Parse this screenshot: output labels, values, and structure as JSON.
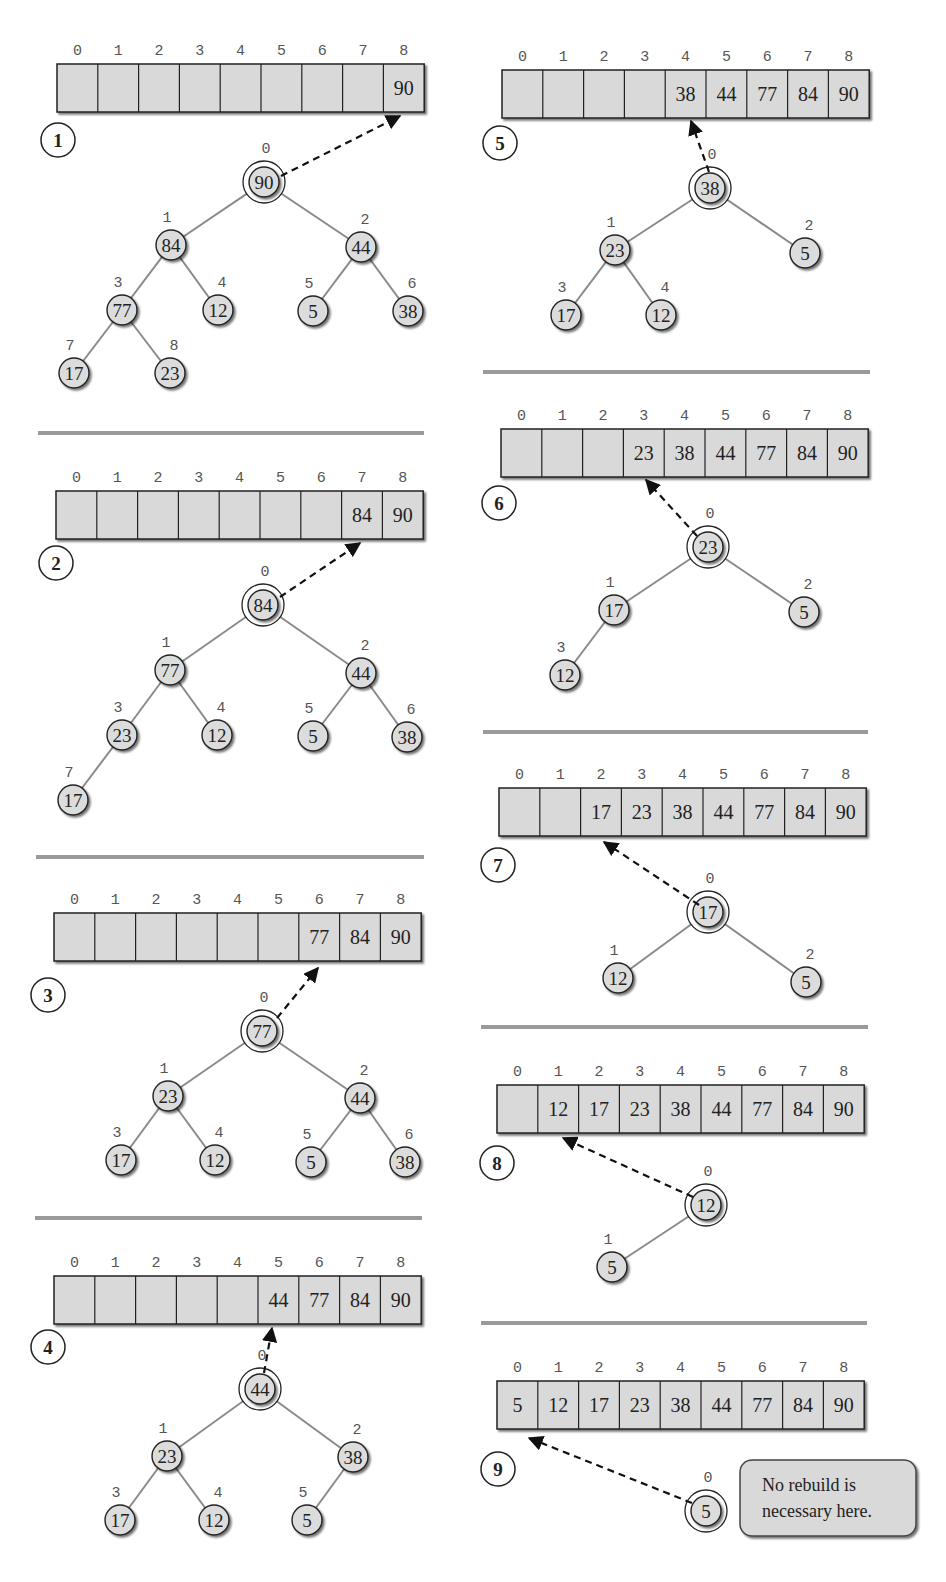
{
  "figure": {
    "colors": {
      "cell_fill": "#d9d9d9",
      "node_fill": "#dcdcdc",
      "edge": "#8a8a8a",
      "separator": "#9a9a9a",
      "text": "#222222",
      "index": "#555555"
    },
    "note": {
      "line1": "No rebuild is",
      "line2": "necessary here."
    },
    "panels": [
      {
        "step": "1",
        "array": [
          "",
          "",
          "",
          "",
          "",
          "",
          "",
          "",
          "90"
        ],
        "array_box": {
          "x": 57,
          "y": 64,
          "cw": 40.8,
          "h": 48
        },
        "circle": {
          "x": 58,
          "y": 140
        },
        "arrow": {
          "x1": 281,
          "y1": 176,
          "x2": 400,
          "y2": 116
        },
        "nodes": [
          {
            "i": 0,
            "v": "90",
            "x": 264,
            "y": 182
          },
          {
            "i": 1,
            "v": "84",
            "x": 171,
            "y": 245
          },
          {
            "i": 2,
            "v": "44",
            "x": 361,
            "y": 247
          },
          {
            "i": 3,
            "v": "77",
            "x": 122,
            "y": 310
          },
          {
            "i": 4,
            "v": "12",
            "x": 218,
            "y": 310
          },
          {
            "i": 5,
            "v": "5",
            "x": 313,
            "y": 311
          },
          {
            "i": 6,
            "v": "38",
            "x": 408,
            "y": 311
          },
          {
            "i": 7,
            "v": "17",
            "x": 74,
            "y": 373
          },
          {
            "i": 8,
            "v": "23",
            "x": 170,
            "y": 373
          }
        ],
        "edges": [
          [
            0,
            1
          ],
          [
            0,
            2
          ],
          [
            1,
            3
          ],
          [
            1,
            4
          ],
          [
            2,
            5
          ],
          [
            2,
            6
          ],
          [
            3,
            7
          ],
          [
            3,
            8
          ]
        ]
      },
      {
        "step": "2",
        "array": [
          "",
          "",
          "",
          "",
          "",
          "",
          "",
          "84",
          "90"
        ],
        "array_box": {
          "x": 56,
          "y": 491,
          "cw": 40.8,
          "h": 48
        },
        "circle": {
          "x": 56,
          "y": 563
        },
        "arrow": {
          "x1": 280,
          "y1": 597,
          "x2": 360,
          "y2": 543
        },
        "nodes": [
          {
            "i": 0,
            "v": "84",
            "x": 263,
            "y": 605
          },
          {
            "i": 1,
            "v": "77",
            "x": 170,
            "y": 670
          },
          {
            "i": 2,
            "v": "44",
            "x": 361,
            "y": 673
          },
          {
            "i": 3,
            "v": "23",
            "x": 122,
            "y": 735
          },
          {
            "i": 4,
            "v": "12",
            "x": 217,
            "y": 735
          },
          {
            "i": 5,
            "v": "5",
            "x": 313,
            "y": 736
          },
          {
            "i": 6,
            "v": "38",
            "x": 407,
            "y": 737
          },
          {
            "i": 7,
            "v": "17",
            "x": 73,
            "y": 800
          }
        ],
        "edges": [
          [
            0,
            1
          ],
          [
            0,
            2
          ],
          [
            1,
            3
          ],
          [
            1,
            4
          ],
          [
            2,
            5
          ],
          [
            2,
            6
          ],
          [
            3,
            7
          ]
        ]
      },
      {
        "step": "3",
        "array": [
          "",
          "",
          "",
          "",
          "",
          "",
          "77",
          "84",
          "90"
        ],
        "array_box": {
          "x": 54,
          "y": 913,
          "cw": 40.8,
          "h": 48
        },
        "circle": {
          "x": 48,
          "y": 995
        },
        "arrow": {
          "x1": 277,
          "y1": 1018,
          "x2": 318,
          "y2": 968
        },
        "nodes": [
          {
            "i": 0,
            "v": "77",
            "x": 262,
            "y": 1031
          },
          {
            "i": 1,
            "v": "23",
            "x": 168,
            "y": 1096
          },
          {
            "i": 2,
            "v": "44",
            "x": 360,
            "y": 1098
          },
          {
            "i": 3,
            "v": "17",
            "x": 121,
            "y": 1160
          },
          {
            "i": 4,
            "v": "12",
            "x": 215,
            "y": 1160
          },
          {
            "i": 5,
            "v": "5",
            "x": 311,
            "y": 1162
          },
          {
            "i": 6,
            "v": "38",
            "x": 405,
            "y": 1162
          }
        ],
        "edges": [
          [
            0,
            1
          ],
          [
            0,
            2
          ],
          [
            1,
            3
          ],
          [
            1,
            4
          ],
          [
            2,
            5
          ],
          [
            2,
            6
          ]
        ]
      },
      {
        "step": "4",
        "array": [
          "",
          "",
          "",
          "",
          "",
          "44",
          "77",
          "84",
          "90"
        ],
        "array_box": {
          "x": 54,
          "y": 1276,
          "cw": 40.8,
          "h": 48
        },
        "circle": {
          "x": 48,
          "y": 1347
        },
        "arrow": {
          "x1": 264,
          "y1": 1373,
          "x2": 272,
          "y2": 1328
        },
        "nodes": [
          {
            "i": 0,
            "v": "44",
            "x": 260,
            "y": 1389
          },
          {
            "i": 1,
            "v": "23",
            "x": 167,
            "y": 1456
          },
          {
            "i": 2,
            "v": "38",
            "x": 353,
            "y": 1457
          },
          {
            "i": 3,
            "v": "17",
            "x": 120,
            "y": 1520
          },
          {
            "i": 4,
            "v": "12",
            "x": 214,
            "y": 1520
          },
          {
            "i": 5,
            "v": "5",
            "x": 307,
            "y": 1520
          }
        ],
        "edges": [
          [
            0,
            1
          ],
          [
            0,
            2
          ],
          [
            1,
            3
          ],
          [
            1,
            4
          ],
          [
            2,
            5
          ]
        ]
      },
      {
        "step": "5",
        "array": [
          "",
          "",
          "",
          "",
          "38",
          "44",
          "77",
          "84",
          "90"
        ],
        "array_box": {
          "x": 502,
          "y": 70,
          "cw": 40.8,
          "h": 48
        },
        "circle": {
          "x": 500,
          "y": 143
        },
        "arrow": {
          "x1": 709,
          "y1": 172,
          "x2": 691,
          "y2": 121
        },
        "nodes": [
          {
            "i": 0,
            "v": "38",
            "x": 710,
            "y": 188
          },
          {
            "i": 1,
            "v": "23",
            "x": 615,
            "y": 250
          },
          {
            "i": 2,
            "v": "5",
            "x": 805,
            "y": 253
          },
          {
            "i": 3,
            "v": "17",
            "x": 566,
            "y": 315
          },
          {
            "i": 4,
            "v": "12",
            "x": 661,
            "y": 315
          }
        ],
        "edges": [
          [
            0,
            1
          ],
          [
            0,
            2
          ],
          [
            1,
            3
          ],
          [
            1,
            4
          ]
        ]
      },
      {
        "step": "6",
        "array": [
          "",
          "",
          "",
          "23",
          "38",
          "44",
          "77",
          "84",
          "90"
        ],
        "array_box": {
          "x": 501,
          "y": 429,
          "cw": 40.8,
          "h": 48
        },
        "circle": {
          "x": 499,
          "y": 503
        },
        "arrow": {
          "x1": 697,
          "y1": 536,
          "x2": 646,
          "y2": 480
        },
        "nodes": [
          {
            "i": 0,
            "v": "23",
            "x": 708,
            "y": 547
          },
          {
            "i": 1,
            "v": "17",
            "x": 614,
            "y": 610
          },
          {
            "i": 2,
            "v": "5",
            "x": 804,
            "y": 612
          },
          {
            "i": 3,
            "v": "12",
            "x": 565,
            "y": 675
          }
        ],
        "edges": [
          [
            0,
            1
          ],
          [
            0,
            2
          ],
          [
            1,
            3
          ]
        ]
      },
      {
        "step": "7",
        "array": [
          "",
          "",
          "17",
          "23",
          "38",
          "44",
          "77",
          "84",
          "90"
        ],
        "array_box": {
          "x": 499,
          "y": 788,
          "cw": 40.8,
          "h": 48
        },
        "circle": {
          "x": 498,
          "y": 865
        },
        "arrow": {
          "x1": 699,
          "y1": 905,
          "x2": 604,
          "y2": 842
        },
        "nodes": [
          {
            "i": 0,
            "v": "17",
            "x": 708,
            "y": 912
          },
          {
            "i": 1,
            "v": "12",
            "x": 618,
            "y": 978
          },
          {
            "i": 2,
            "v": "5",
            "x": 806,
            "y": 982
          }
        ],
        "edges": [
          [
            0,
            1
          ],
          [
            0,
            2
          ]
        ]
      },
      {
        "step": "8",
        "array": [
          "",
          "12",
          "17",
          "23",
          "38",
          "44",
          "77",
          "84",
          "90"
        ],
        "array_box": {
          "x": 497,
          "y": 1085,
          "cw": 40.8,
          "h": 48
        },
        "circle": {
          "x": 497,
          "y": 1163
        },
        "arrow": {
          "x1": 693,
          "y1": 1197,
          "x2": 563,
          "y2": 1138
        },
        "nodes": [
          {
            "i": 0,
            "v": "12",
            "x": 706,
            "y": 1205
          },
          {
            "i": 1,
            "v": "5",
            "x": 612,
            "y": 1267
          }
        ],
        "edges": [
          [
            0,
            1
          ]
        ]
      },
      {
        "step": "9",
        "array": [
          "5",
          "12",
          "17",
          "23",
          "38",
          "44",
          "77",
          "84",
          "90"
        ],
        "array_box": {
          "x": 497,
          "y": 1381,
          "cw": 40.8,
          "h": 48
        },
        "circle": {
          "x": 498,
          "y": 1469
        },
        "arrow": {
          "x1": 692,
          "y1": 1503,
          "x2": 529,
          "y2": 1438
        },
        "nodes": [
          {
            "i": 0,
            "v": "5",
            "x": 706,
            "y": 1511
          }
        ],
        "edges": []
      }
    ],
    "separators": [
      {
        "x1": 38,
        "x2": 424,
        "y": 433
      },
      {
        "x1": 36,
        "x2": 424,
        "y": 857
      },
      {
        "x1": 35,
        "x2": 422,
        "y": 1218
      },
      {
        "x1": 483,
        "x2": 870,
        "y": 372
      },
      {
        "x1": 483,
        "x2": 868,
        "y": 732
      },
      {
        "x1": 481,
        "x2": 868,
        "y": 1027
      },
      {
        "x1": 481,
        "x2": 867,
        "y": 1323
      }
    ]
  }
}
